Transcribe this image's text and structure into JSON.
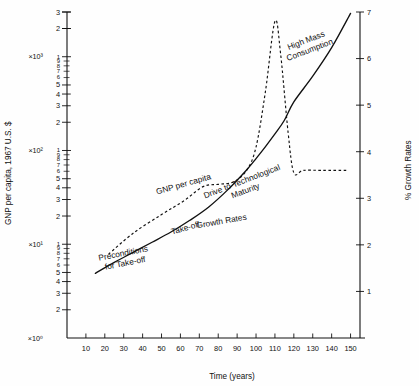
{
  "chart_data": {
    "type": "line",
    "title": "",
    "xlabel": "Time (years)",
    "ylabel": "GNP per capita, 1967 U.S. $",
    "y2label": "% Growth Rates",
    "xlim": [
      0,
      155
    ],
    "xticks": [
      10,
      20,
      30,
      40,
      50,
      60,
      70,
      80,
      90,
      100,
      110,
      120,
      130,
      140,
      150
    ],
    "y_left_scale": "log",
    "y_left_lim": [
      1,
      3000
    ],
    "y_left_decade_labels": [
      "×10⁰",
      "×10¹",
      "×10²",
      "×10³"
    ],
    "y_left_minor_ticks": [
      2,
      3,
      4,
      5,
      6,
      7,
      8,
      9
    ],
    "y_right_scale": "linear",
    "y_right_lim": [
      0,
      7
    ],
    "y_right_ticks": [
      1,
      2,
      3,
      4,
      5,
      6,
      7
    ],
    "grid": false,
    "legend_position": "inline-annotations",
    "series": [
      {
        "name": "GNP per capita",
        "style": "solid",
        "axis": "left",
        "x": [
          15,
          25,
          35,
          45,
          55,
          65,
          75,
          85,
          95,
          100,
          105,
          110,
          115,
          120,
          130,
          140,
          150
        ],
        "y": [
          4.9,
          6.4,
          8.2,
          10.5,
          13.5,
          18,
          25,
          38,
          62,
          82,
          110,
          150,
          210,
          330,
          620,
          1250,
          2900
        ]
      },
      {
        "name": "Growth Rates",
        "style": "dotted",
        "axis": "right",
        "x": [
          22,
          35,
          50,
          62,
          72,
          80,
          88,
          95,
          100,
          105,
          110,
          113,
          117,
          120,
          125,
          135,
          148
        ],
        "y": [
          1.8,
          2.25,
          2.65,
          2.95,
          3.25,
          3.3,
          3.35,
          3.6,
          4.1,
          5.3,
          6.8,
          6.1,
          4.4,
          3.55,
          3.6,
          3.6,
          3.6
        ]
      }
    ],
    "annotations": [
      {
        "text": "Preconditions for Take-off",
        "lines": [
          "Preconditions",
          "for Take-off"
        ],
        "x": 30,
        "y": 7.5,
        "rotation": -11
      },
      {
        "text": "Take-off",
        "lines": [
          "Take-off"
        ],
        "x": 63,
        "y": 14,
        "rotation": -16
      },
      {
        "text": "GNP per capita",
        "lines": [
          "GNP per capita"
        ],
        "x": 62,
        "y": 41,
        "rotation": -16
      },
      {
        "text": "Drive to Technological Maturity",
        "lines": [
          "Drive to Technological",
          "Maturity"
        ],
        "x": 93,
        "y": 44,
        "rotation": -21
      },
      {
        "text": "High Mass Consumption",
        "lines": [
          "High Mass",
          "Consumption"
        ],
        "x": 127,
        "y": 1400,
        "rotation": -21
      },
      {
        "text": "Growth Rates",
        "lines": [
          "Growth Rates"
        ],
        "x": 82,
        "y": 2.45,
        "rotation": -10
      }
    ]
  }
}
